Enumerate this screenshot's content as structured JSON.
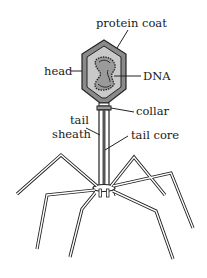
{
  "diagram": {
    "labels": {
      "protein_coat": "protein coat",
      "head": "head",
      "dna": "DNA",
      "collar": "collar",
      "tail_sheath_line1": "tail",
      "tail_sheath_line2": "sheath",
      "tail_core": "tail core"
    },
    "colors": {
      "outline": "#222222",
      "coat_fill": "#8a8a8a",
      "inner_fill": "#c4c4c4",
      "dna_fill": "#9a9a9a",
      "core": "#555555",
      "background": "#ffffff"
    }
  }
}
